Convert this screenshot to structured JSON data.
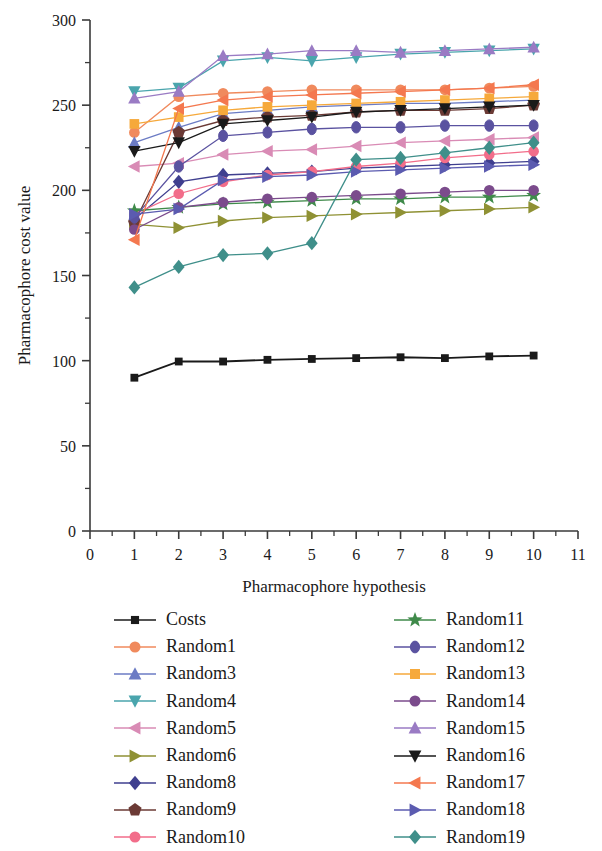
{
  "chart_data": {
    "type": "line",
    "title": "",
    "xlabel": "Pharmacophore hypothesis",
    "ylabel": "Pharmacophore cost value",
    "xlim": [
      0,
      11
    ],
    "ylim": [
      0,
      300
    ],
    "xticks": [
      0,
      1,
      2,
      3,
      4,
      5,
      6,
      7,
      8,
      9,
      10,
      11
    ],
    "yticks": [
      0,
      50,
      100,
      150,
      200,
      250,
      300
    ],
    "xtick_labels": [
      "0",
      "1",
      "2",
      "3",
      "4",
      "5",
      "6",
      "7",
      "8",
      "9",
      "10",
      "11"
    ],
    "ytick_labels": [
      "0",
      "50",
      "100",
      "150",
      "200",
      "250",
      "300"
    ],
    "minor_ticks": true,
    "grid": false,
    "legend_position": "below-two-columns",
    "x": [
      1,
      2,
      3,
      4,
      5,
      6,
      7,
      8,
      9,
      10
    ],
    "series": [
      {
        "name": "Costs",
        "marker": "square",
        "color": "#1a1a1a",
        "line_color": "#1a1a1a",
        "values": [
          90,
          99.5,
          99.5,
          100.5,
          101,
          101.5,
          102,
          101.5,
          102.5,
          103
        ]
      },
      {
        "name": "Random1",
        "marker": "circle",
        "color": "#f08a5d",
        "line_color": "#f08a5d",
        "values": [
          234,
          255,
          257,
          258,
          259,
          259,
          259,
          259,
          260,
          261
        ]
      },
      {
        "name": "Random3",
        "marker": "triangle-up",
        "color": "#6b7bc4",
        "line_color": "#6b7bc4",
        "values": [
          228,
          237,
          245,
          247,
          249,
          250,
          251,
          251,
          252,
          253
        ]
      },
      {
        "name": "Random4",
        "marker": "triangle-down",
        "color": "#4aa5ad",
        "line_color": "#4aa5ad",
        "values": [
          258,
          260,
          276,
          278,
          276,
          278,
          280,
          281,
          282,
          283
        ]
      },
      {
        "name": "Random5",
        "marker": "triangle-left",
        "color": "#d98bb5",
        "line_color": "#d98bb5",
        "values": [
          214,
          216,
          221,
          223,
          224,
          226,
          228,
          229,
          230,
          231
        ]
      },
      {
        "name": "Random6",
        "marker": "triangle-right",
        "color": "#8f9134",
        "line_color": "#8f9134",
        "values": [
          180,
          178,
          182,
          184,
          185,
          186,
          187,
          188,
          189,
          190
        ]
      },
      {
        "name": "Random8",
        "marker": "diamond",
        "color": "#3f3f8f",
        "line_color": "#3f3f8f",
        "values": [
          183,
          205,
          209,
          210,
          211,
          213,
          214,
          215,
          216,
          217
        ]
      },
      {
        "name": "Random9",
        "marker": "pentagon",
        "color": "#6b3a35",
        "line_color": "#6b3a35",
        "values": [
          181,
          234,
          241,
          243,
          244,
          246,
          247,
          247,
          248,
          250
        ]
      },
      {
        "name": "Random10",
        "marker": "circle",
        "color": "#f26d8a",
        "line_color": "#f26d8a",
        "values": [
          186,
          198,
          205,
          209,
          211,
          214,
          216,
          219,
          221,
          223
        ]
      },
      {
        "name": "Random11",
        "marker": "star",
        "color": "#3f8a4a",
        "line_color": "#3f8a4a",
        "values": [
          188,
          190,
          192,
          193,
          194,
          195,
          195,
          196,
          196,
          197
        ]
      },
      {
        "name": "Random12",
        "marker": "circle-open",
        "color": "#5a52a0",
        "line_color": "#5a52a0",
        "values": [
          184,
          214,
          232,
          234,
          236,
          237,
          237,
          238,
          238,
          238
        ]
      },
      {
        "name": "Random13",
        "marker": "square",
        "color": "#f6a93b",
        "line_color": "#f6a93b",
        "values": [
          239,
          243,
          247,
          249,
          250,
          251,
          252,
          253,
          254,
          255
        ]
      },
      {
        "name": "Random14",
        "marker": "circle",
        "color": "#7b4b8c",
        "line_color": "#7b4b8c",
        "values": [
          177,
          190,
          193,
          195,
          196,
          197,
          198,
          199,
          200,
          200
        ]
      },
      {
        "name": "Random15",
        "marker": "triangle-up",
        "color": "#9a7bc4",
        "line_color": "#9a7bc4",
        "values": [
          254,
          258,
          279,
          280,
          282,
          282,
          281,
          282,
          283,
          284
        ]
      },
      {
        "name": "Random16",
        "marker": "triangle-down",
        "color": "#1a1a1a",
        "line_color": "#1a1a1a",
        "values": [
          223,
          228,
          239,
          241,
          243,
          246,
          247,
          248,
          249,
          250
        ]
      },
      {
        "name": "Random17",
        "marker": "triangle-left",
        "color": "#f4784f",
        "line_color": "#f4784f",
        "values": [
          171,
          248,
          253,
          255,
          256,
          257,
          258,
          259,
          260,
          262
        ]
      },
      {
        "name": "Random18",
        "marker": "triangle-right",
        "color": "#5b5bb0",
        "line_color": "#5b5bb0",
        "values": [
          186,
          189,
          206,
          208,
          209,
          211,
          212,
          213,
          214,
          215
        ]
      },
      {
        "name": "Random19",
        "marker": "diamond",
        "color": "#3f8f8a",
        "line_color": "#3f8f8a",
        "values": [
          143,
          155,
          162,
          163,
          169,
          218,
          219,
          222,
          225,
          228
        ]
      }
    ]
  },
  "legend": {
    "left_column": [
      "Costs",
      "Random1",
      "Random3",
      "Random4",
      "Random5",
      "Random6",
      "Random8",
      "Random9",
      "Random10"
    ],
    "right_column": [
      "Random11",
      "Random12",
      "Random13",
      "Random14",
      "Random15",
      "Random16",
      "Random17",
      "Random18",
      "Random19"
    ]
  }
}
